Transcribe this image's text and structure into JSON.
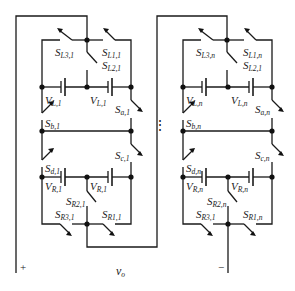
{
  "diagram": {
    "type": "circuit-schematic",
    "title": "",
    "modules": [
      {
        "id": "1",
        "switches_top": [
          {
            "name": "S",
            "sub": "L3,1"
          },
          {
            "name": "S",
            "sub": "L1,1"
          },
          {
            "name": "S",
            "sub": "L2,1"
          }
        ],
        "sources_top": [
          {
            "name": "V",
            "sub": "L,1"
          },
          {
            "name": "V",
            "sub": "L,1"
          }
        ],
        "switches_mid": [
          {
            "name": "S",
            "sub": "a,1"
          },
          {
            "name": "S",
            "sub": "b,1"
          },
          {
            "name": "S",
            "sub": "c,1"
          },
          {
            "name": "S",
            "sub": "d,1"
          }
        ],
        "sources_bottom": [
          {
            "name": "V",
            "sub": "R,1"
          },
          {
            "name": "V",
            "sub": "R,1"
          }
        ],
        "switches_bottom": [
          {
            "name": "S",
            "sub": "R2,1"
          },
          {
            "name": "S",
            "sub": "R3,1"
          },
          {
            "name": "S",
            "sub": "R1,1"
          }
        ]
      },
      {
        "id": "n",
        "switches_top": [
          {
            "name": "S",
            "sub": "L3,n"
          },
          {
            "name": "S",
            "sub": "L1,n"
          },
          {
            "name": "S",
            "sub": "L2,1"
          }
        ],
        "sources_top": [
          {
            "name": "V",
            "sub": "L,n"
          },
          {
            "name": "V",
            "sub": "L,n"
          }
        ],
        "switches_mid": [
          {
            "name": "S",
            "sub": "a,n"
          },
          {
            "name": "S",
            "sub": "b,n"
          },
          {
            "name": "S",
            "sub": "c,n"
          },
          {
            "name": "S",
            "sub": "d,n"
          }
        ],
        "sources_bottom": [
          {
            "name": "V",
            "sub": "R,n"
          },
          {
            "name": "V",
            "sub": "R,n"
          }
        ],
        "switches_bottom": [
          {
            "name": "S",
            "sub": "R2,n"
          },
          {
            "name": "S",
            "sub": "R3,1"
          },
          {
            "name": "S",
            "sub": "R1,n"
          }
        ]
      }
    ],
    "ellipsis": "⋮",
    "output": {
      "label": "v",
      "sub": "o",
      "plus": "+",
      "minus": "−"
    }
  }
}
